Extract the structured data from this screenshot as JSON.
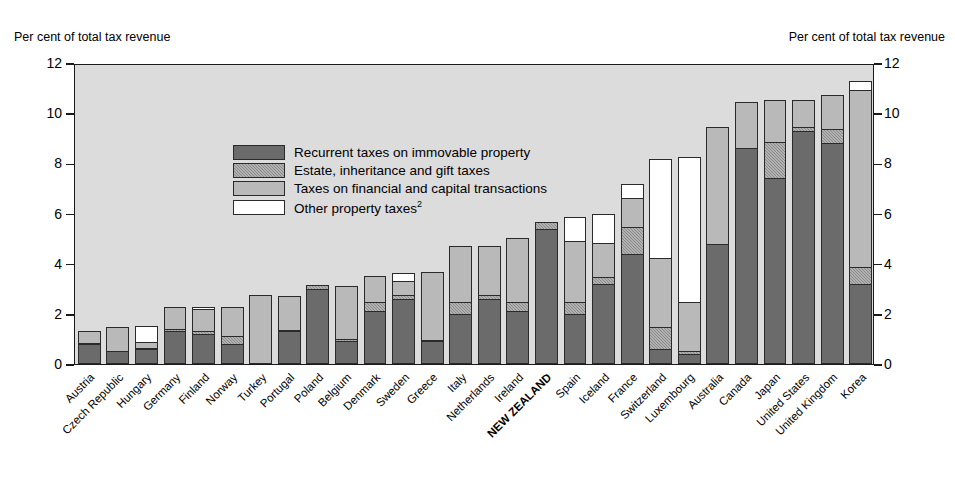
{
  "captions": {
    "left": "Per cent of total tax revenue",
    "right": "Per cent of total tax revenue"
  },
  "legend": [
    {
      "key": "recurrent",
      "label": "Recurrent taxes on immovable property",
      "sup": "",
      "color": "#6b6b6b"
    },
    {
      "key": "estate",
      "label": "Estate, inheritance and gift taxes",
      "sup": "",
      "color": "#8a8a8a"
    },
    {
      "key": "financial",
      "label": "Taxes on financial and capital transactions",
      "sup": "",
      "color": "#b9b9b9"
    },
    {
      "key": "other",
      "label": "Other property taxes",
      "sup": "2",
      "color": "#ffffff"
    }
  ],
  "yticks": [
    "0",
    "2",
    "4",
    "6",
    "8",
    "10",
    "12"
  ],
  "chart_data": {
    "type": "bar",
    "stacked": true,
    "title": "",
    "xlabel": "",
    "ylabel": "Per cent of total tax revenue",
    "ylim": [
      0,
      12
    ],
    "ytick_values": [
      0,
      2,
      4,
      6,
      8,
      10,
      12
    ],
    "grid": false,
    "legend_position": "inside-top-left",
    "highlight_category": "NEW ZEALAND",
    "series_order": [
      "recurrent",
      "estate",
      "financial",
      "other"
    ],
    "categories": [
      "Austria",
      "Czech Republic",
      "Hungary",
      "Germany",
      "Finland",
      "Norway",
      "Turkey",
      "Portugal",
      "Poland",
      "Belgium",
      "Denmark",
      "Sweden",
      "Greece",
      "Italy",
      "Netherlands",
      "Ireland",
      "NEW ZEALAND",
      "Spain",
      "Iceland",
      "France",
      "Switzerland",
      "Luxembourg",
      "Australia",
      "Canada",
      "Japan",
      "United States",
      "United Kingdom",
      "Korea"
    ],
    "series": [
      {
        "name": "Recurrent taxes on immovable property",
        "values": [
          0.8,
          0.5,
          0.6,
          1.3,
          1.2,
          0.8,
          0.0,
          1.3,
          3.0,
          0.9,
          2.1,
          2.6,
          0.9,
          2.0,
          2.6,
          2.1,
          5.4,
          2.0,
          3.2,
          4.4,
          0.6,
          0.4,
          4.8,
          8.6,
          7.4,
          9.3,
          8.8,
          3.2
        ]
      },
      {
        "name": "Estate, inheritance and gift taxes",
        "values": [
          0.1,
          0.05,
          0.05,
          0.15,
          0.15,
          0.35,
          0.0,
          0.1,
          0.2,
          0.15,
          0.4,
          0.2,
          0.1,
          0.5,
          0.2,
          0.4,
          0.3,
          0.5,
          0.3,
          1.1,
          0.9,
          0.15,
          0.0,
          0.0,
          1.5,
          0.2,
          0.6,
          0.7
        ]
      },
      {
        "name": "Taxes on financial and capital transactions",
        "values": [
          0.5,
          1.0,
          0.3,
          0.9,
          0.95,
          1.2,
          2.75,
          1.4,
          0.0,
          2.15,
          1.1,
          0.6,
          2.75,
          2.3,
          2.0,
          2.6,
          0.0,
          2.5,
          1.4,
          1.2,
          2.8,
          2.0,
          4.7,
          1.9,
          1.7,
          1.1,
          1.4,
          7.1
        ]
      },
      {
        "name": "Other property taxes",
        "values": [
          0.0,
          0.0,
          0.65,
          0.0,
          0.1,
          0.0,
          0.0,
          0.0,
          0.0,
          0.0,
          0.0,
          0.35,
          0.0,
          0.0,
          0.0,
          0.0,
          0.0,
          1.0,
          1.2,
          0.6,
          4.0,
          5.85,
          0.0,
          0.0,
          0.0,
          0.0,
          0.0,
          0.4
        ]
      }
    ]
  }
}
